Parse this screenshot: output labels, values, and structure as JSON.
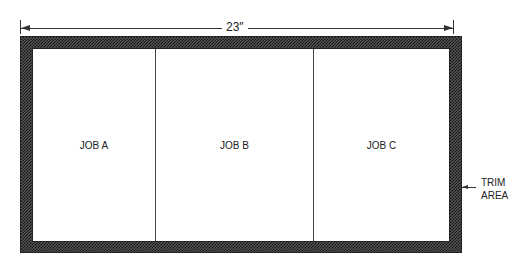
{
  "dimension": {
    "label": "23″"
  },
  "sheet": {
    "jobs": [
      {
        "label": "JOB A"
      },
      {
        "label": "JOB B"
      },
      {
        "label": "JOB C"
      }
    ]
  },
  "trim": {
    "line1": "TRIM",
    "line2": "AREA"
  },
  "colors": {
    "line": "#333333",
    "trim_pattern": "#111111",
    "background": "#ffffff"
  }
}
